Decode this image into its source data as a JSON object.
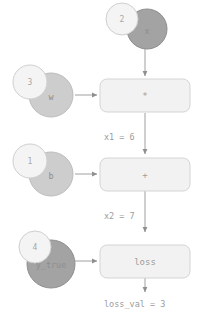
{
  "diagram": {
    "colors": {
      "value_circle_fill": "#f4f4f4",
      "value_circle_stroke": "#cfcfcf",
      "var_circle_dark_fill": "#a3a3a3",
      "var_circle_dark_stroke": "#8f8f8f",
      "var_circle_light_fill": "#cdcdcd",
      "var_circle_light_stroke": "#bcbcbc",
      "op_box_fill": "#f2f2f2",
      "op_box_stroke": "#d4d4d4",
      "edge_stroke": "#a0a0a0",
      "text": "#9a9a9a",
      "background": "#ffffff"
    },
    "variables": [
      {
        "id": "x",
        "value": "2",
        "name": "x",
        "shade": "dark"
      },
      {
        "id": "w",
        "value": "3",
        "name": "w",
        "shade": "light"
      },
      {
        "id": "b",
        "value": "1",
        "name": "b",
        "shade": "light"
      },
      {
        "id": "y_true",
        "value": "4",
        "name": "y_true",
        "shade": "dark"
      }
    ],
    "operations": [
      {
        "id": "mul",
        "label": "*"
      },
      {
        "id": "add",
        "label": "+"
      },
      {
        "id": "loss",
        "label": "loss"
      }
    ],
    "edge_labels": [
      {
        "id": "x1",
        "text": "x1 = 6"
      },
      {
        "id": "x2",
        "text": "x2 = 7"
      },
      {
        "id": "loss_val",
        "text": "loss_val = 3"
      }
    ]
  }
}
